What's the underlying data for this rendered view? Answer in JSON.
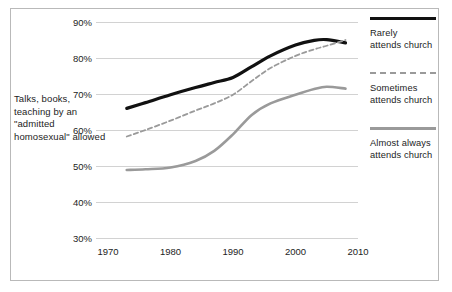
{
  "figure": {
    "axis_caption": "Talks, books, teaching by an \"admitted homosexual\" allowed"
  },
  "legend": {
    "position": "right",
    "items": [
      {
        "label_line1": "Rarely",
        "label_line2": "attends church",
        "style": "solid",
        "color": "#111111"
      },
      {
        "label_line1": "Sometimes",
        "label_line2": "attends church",
        "style": "dashed",
        "color": "#9a9a9a"
      },
      {
        "label_line1": "Almost always",
        "label_line2": "attends church",
        "style": "solid",
        "color": "#9a9a9a"
      }
    ]
  },
  "chart_data": {
    "type": "line",
    "title": "",
    "xlabel": "",
    "ylabel": "Talks, books, teaching by an \"admitted homosexual\" allowed",
    "xlim": [
      1970,
      2010
    ],
    "ylim": [
      30,
      90
    ],
    "xticks": [
      1970,
      1980,
      1990,
      2000,
      2010
    ],
    "xtick_labels": [
      "1970",
      "1980",
      "1990",
      "2000",
      "2010"
    ],
    "yticks": [
      30,
      40,
      50,
      60,
      70,
      80,
      90
    ],
    "ytick_labels": [
      "30%",
      "40%",
      "50%",
      "60%",
      "70%",
      "80%",
      "90%"
    ],
    "grid": true,
    "grid_axis": "y",
    "series": [
      {
        "name": "Rarely attends church",
        "style": "solid",
        "color": "#111111",
        "width": 3.2,
        "x": [
          1973,
          1976,
          1980,
          1984,
          1987,
          1990,
          1993,
          1996,
          2000,
          2003,
          2005,
          2008
        ],
        "values": [
          66.0,
          67.6,
          69.8,
          71.8,
          73.2,
          74.6,
          77.6,
          80.6,
          83.6,
          84.9,
          85.1,
          84.2
        ]
      },
      {
        "name": "Sometimes attends church",
        "style": "dashed",
        "color": "#9a9a9a",
        "width": 1.8,
        "x": [
          1973,
          1976,
          1980,
          1984,
          1987,
          1990,
          1993,
          1996,
          2000,
          2003,
          2005,
          2008
        ],
        "values": [
          58.2,
          60.0,
          62.6,
          65.4,
          67.4,
          69.8,
          73.6,
          77.2,
          80.6,
          82.4,
          83.4,
          85.0
        ]
      },
      {
        "name": "Almost always attends church",
        "style": "solid",
        "color": "#9a9a9a",
        "width": 2.6,
        "x": [
          1973,
          1976,
          1980,
          1984,
          1987,
          1990,
          1993,
          1996,
          2000,
          2003,
          2005,
          2008
        ],
        "values": [
          48.9,
          49.1,
          49.6,
          51.4,
          54.2,
          58.8,
          64.2,
          67.4,
          69.8,
          71.4,
          72.0,
          71.5
        ]
      }
    ]
  }
}
